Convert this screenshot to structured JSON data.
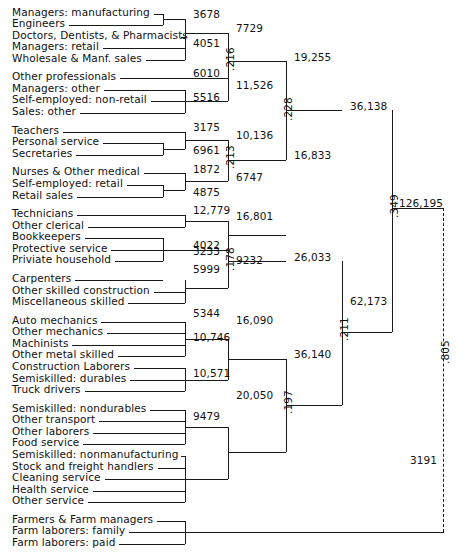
{
  "figure": {
    "type": "dendrogram"
  },
  "leaves": [
    {
      "label": "Managers:  manufacturing",
      "y": 13,
      "lineEnd": 163
    },
    {
      "label": "Engineers",
      "y": 26,
      "lineEnd": 163
    },
    {
      "label": "Doctors, Dentists, & Pharmacists",
      "y": 39,
      "lineEnd": 185
    },
    {
      "label": "Managers:  retail",
      "y": 52,
      "lineEnd": 185
    },
    {
      "label": "Wholesale & Manf. sales",
      "y": 65,
      "lineEnd": 185
    },
    {
      "label": "Other professionals",
      "y": 86,
      "lineEnd": 228
    },
    {
      "label": "Managers:  other",
      "y": 99,
      "lineEnd": 185
    },
    {
      "label": "Self-employed:  non-retail",
      "y": 112,
      "lineEnd": 185
    },
    {
      "label": "Sales:  other",
      "y": 125,
      "lineEnd": 185
    },
    {
      "label": "Teachers",
      "y": 146,
      "lineEnd": 185
    },
    {
      "label": "Personal service",
      "y": 159,
      "lineEnd": 163
    },
    {
      "label": "Secretaries",
      "y": 172,
      "lineEnd": 163
    },
    {
      "label": "Nurses & Other medical",
      "y": 193,
      "lineEnd": 185
    },
    {
      "label": "Self-employed:  retail",
      "y": 206,
      "lineEnd": 163
    },
    {
      "label": "Retail sales",
      "y": 219,
      "lineEnd": 163
    },
    {
      "label": "Technicians",
      "y": 240,
      "lineEnd": 185
    },
    {
      "label": "Other clerical",
      "y": 253,
      "lineEnd": 185
    },
    {
      "label": "Bookkeepers",
      "y": 266,
      "lineEnd": 163
    },
    {
      "label": "Protective service",
      "y": 279,
      "lineEnd": 163
    },
    {
      "label": "Priviate household",
      "y": 292,
      "lineEnd": 163
    },
    {
      "label": "Carpenters",
      "y": 313,
      "lineEnd": 163
    },
    {
      "label": "Other skilled construction",
      "y": 326,
      "lineEnd": 185
    },
    {
      "label": "Miscellaneous skilled",
      "y": 339,
      "lineEnd": 185
    },
    {
      "label": "Auto mechanics",
      "y": 360,
      "lineEnd": 185
    },
    {
      "label": "Other mechanics",
      "y": 373,
      "lineEnd": 185
    },
    {
      "label": "Machinists",
      "y": 386,
      "lineEnd": 185
    },
    {
      "label": "Other metal skilled",
      "y": 399,
      "lineEnd": 185
    },
    {
      "label": "Construction Laborers",
      "y": 412,
      "lineEnd": 185
    },
    {
      "label": "Semiskilled:  durables",
      "y": 425,
      "lineEnd": 185
    },
    {
      "label": "Truck drivers",
      "y": 438,
      "lineEnd": 185
    },
    {
      "label": "Semiskilled:  nondurables",
      "y": 459,
      "lineEnd": 185
    },
    {
      "label": "Other transport",
      "y": 472,
      "lineEnd": 185
    },
    {
      "label": "Other laborers",
      "y": 485,
      "lineEnd": 185
    },
    {
      "label": "Food service",
      "y": 498,
      "lineEnd": 185
    },
    {
      "label": "Semiskilled:  nonmanufacturing",
      "y": 511,
      "lineEnd": 185
    },
    {
      "label": "Stock and freight handlers",
      "y": 524,
      "lineEnd": 185
    },
    {
      "label": "Cleaning service",
      "y": 537,
      "lineEnd": 185
    },
    {
      "label": "Health service",
      "y": 550,
      "lineEnd": 185
    },
    {
      "label": "Other service",
      "y": 563,
      "lineEnd": 185
    },
    {
      "label": "Farmers & Farm managers",
      "y": 584,
      "lineEnd": 185
    },
    {
      "label": "Farm laborers:  family",
      "y": 597,
      "lineEnd": 185
    },
    {
      "label": "Farm laborers:  paid",
      "y": 610,
      "lineEnd": 185
    }
  ],
  "node_values": {
    "n3678": "3678",
    "n4051": "4051",
    "n7729": "7729",
    "n6010": "6010",
    "n5516": "5516",
    "n11526": "11,526",
    "n19255": "19,255",
    "n3175": "3175",
    "n6961": "6961",
    "n10136": "10,136",
    "n1872": "1872",
    "n4875": "4875",
    "n6747": "6747",
    "n16833": "16,833",
    "n36138": "36,138",
    "n12779": "12,779",
    "n4022": "4022",
    "n16801": "16,801",
    "n3233": "3233",
    "n5999": "5999",
    "n9232": "9232",
    "n26033": "26,033",
    "n5344": "5344",
    "n10746": "10,746",
    "n16090": "16,090",
    "n10571": "10,571",
    "n9479": "9479",
    "n20050": "20,050",
    "n36140": "36,140",
    "n62173": "62,173",
    "n126195": "126,195",
    "n3191": "3191"
  },
  "correlations": {
    "c216": ".216",
    "c228": ".228",
    "c213": ".213",
    "c178": ".178",
    "c211": ".211",
    "c197": ".197",
    "c349": ".349",
    "c805": ".805"
  },
  "chart_data": {
    "type": "diagram",
    "subtype": "dendrogram",
    "orientation": "left-to-right",
    "leaf_count": 42,
    "merges": [
      {
        "value": "3678",
        "correlation": null,
        "children": [
          "Managers:  manufacturing",
          "Engineers"
        ]
      },
      {
        "value": "4051",
        "correlation": null,
        "children": [
          "Doctors, Dentists, & Pharmacists",
          "Managers:  retail",
          "Wholesale & Manf. sales"
        ]
      },
      {
        "value": "7729",
        "correlation": null,
        "children": [
          "3678",
          "4051"
        ]
      },
      {
        "value": "6010",
        "correlation": null,
        "children": [
          "Other professionals"
        ]
      },
      {
        "value": "5516",
        "correlation": null,
        "children": [
          "Managers:  other",
          "Self-employed:  non-retail",
          "Sales:  other"
        ]
      },
      {
        "value": "11,526",
        "correlation": null,
        "children": [
          "6010",
          "5516"
        ]
      },
      {
        "value": "19,255",
        "correlation": ".216",
        "children": [
          "7729",
          "11,526"
        ]
      },
      {
        "value": "3175",
        "correlation": null,
        "children": [
          "Teachers"
        ]
      },
      {
        "value": "6961",
        "correlation": null,
        "children": [
          "Personal service",
          "Secretaries"
        ]
      },
      {
        "value": "10,136",
        "correlation": null,
        "children": [
          "3175",
          "6961"
        ]
      },
      {
        "value": "1872",
        "correlation": null,
        "children": [
          "Nurses & Other medical"
        ]
      },
      {
        "value": "4875",
        "correlation": null,
        "children": [
          "Self-employed:  retail",
          "Retail sales"
        ]
      },
      {
        "value": "6747",
        "correlation": null,
        "children": [
          "1872",
          "4875"
        ]
      },
      {
        "value": "16,833",
        "correlation": ".213",
        "children": [
          "10,136",
          "6747"
        ]
      },
      {
        "value": "36,138",
        "correlation": ".228",
        "children": [
          "19,255",
          "16,833"
        ]
      },
      {
        "value": "12,779",
        "correlation": null,
        "children": [
          "Technicians",
          "Other clerical"
        ]
      },
      {
        "value": "4022",
        "correlation": null,
        "children": [
          "Bookkeepers",
          "Protective service",
          "Priviate household"
        ]
      },
      {
        "value": "16,801",
        "correlation": null,
        "children": [
          "12,779",
          "4022"
        ]
      },
      {
        "value": "3233",
        "correlation": null,
        "children": [
          "Carpenters"
        ]
      },
      {
        "value": "5999",
        "correlation": null,
        "children": [
          "Other skilled construction",
          "Miscellaneous skilled"
        ]
      },
      {
        "value": "9232",
        "correlation": null,
        "children": [
          "3233",
          "5999"
        ]
      },
      {
        "value": "26,033",
        "correlation": ".178",
        "children": [
          "16,801",
          "9232"
        ]
      },
      {
        "value": "5344",
        "correlation": null,
        "children": [
          "Auto mechanics",
          "Other mechanics",
          "Machinists",
          "Other metal skilled"
        ]
      },
      {
        "value": "10,746",
        "correlation": null,
        "children": [
          "Construction Laborers",
          "Semiskilled:  durables",
          "Truck drivers"
        ]
      },
      {
        "value": "16,090",
        "correlation": null,
        "children": [
          "5344",
          "10,746"
        ]
      },
      {
        "value": "10,571",
        "correlation": null,
        "children": [
          "Semiskilled:  nondurables",
          "Other transport",
          "Other laborers",
          "Food service"
        ]
      },
      {
        "value": "9479",
        "correlation": null,
        "children": [
          "Semiskilled:  nonmanufacturing",
          "Stock and freight handlers",
          "Cleaning service",
          "Health service",
          "Other service"
        ]
      },
      {
        "value": "20,050",
        "correlation": null,
        "children": [
          "10,571",
          "9479"
        ]
      },
      {
        "value": "36,140",
        "correlation": ".197",
        "children": [
          "16,090",
          "20,050"
        ]
      },
      {
        "value": "62,173",
        "correlation": ".211",
        "children": [
          "26,033",
          "36,140"
        ]
      },
      {
        "value": "126,195",
        "correlation": ".349",
        "children": [
          "36,138",
          "62,173"
        ]
      },
      {
        "value": "3191",
        "correlation": null,
        "children": [
          "Farmers & Farm managers",
          "Farm laborers:  family",
          "Farm laborers:  paid"
        ]
      },
      {
        "value": "root",
        "correlation": ".805",
        "children": [
          "126,195",
          "3191"
        ]
      }
    ]
  }
}
